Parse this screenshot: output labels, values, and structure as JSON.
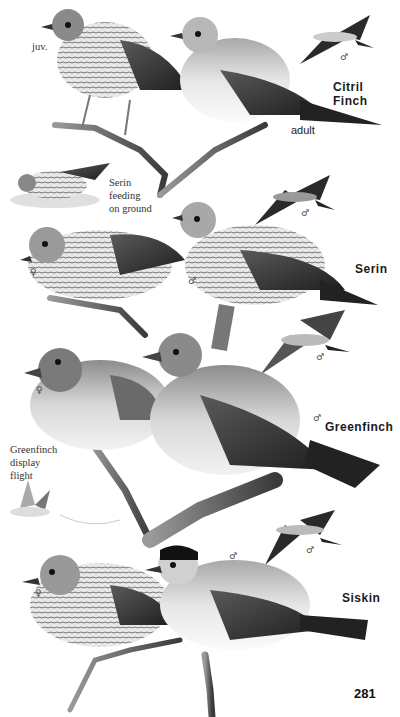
{
  "page": {
    "number": "281",
    "background": "#ffffff"
  },
  "species": [
    {
      "name": "Citril Finch",
      "labels": {
        "juvenile": "juv.",
        "adult": "adult",
        "flight_sex": "♂"
      }
    },
    {
      "name": "Serin",
      "caption": [
        "Serin",
        "feeding",
        "on ground"
      ],
      "labels": {
        "female": "♀",
        "male": "♂",
        "flight_sex": "♂"
      }
    },
    {
      "name": "Greenfinch",
      "caption": [
        "Greenfinch",
        "display",
        "flight"
      ],
      "labels": {
        "female": "♀",
        "male": "♂",
        "flight_sex": "♂"
      }
    },
    {
      "name": "Siskin",
      "labels": {
        "female": "♀",
        "male": "♂",
        "flight_sex": "♂"
      }
    }
  ],
  "palette": {
    "ink_dark": "#1e1e1e",
    "ink_mid": "#6b6b6b",
    "ink_light": "#bdbdbd",
    "paper": "#ffffff"
  }
}
